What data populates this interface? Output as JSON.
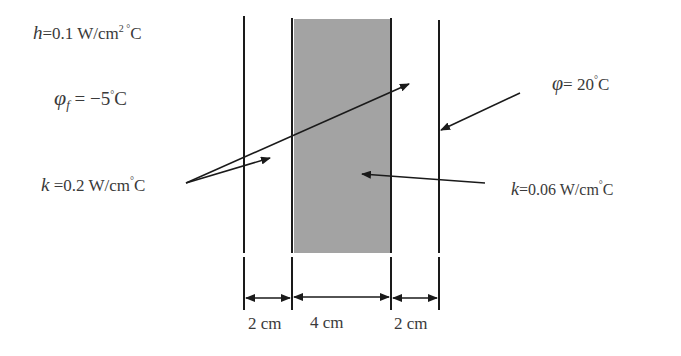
{
  "labels": {
    "h_symbol": "h",
    "h_value": "=0.1 W/cm",
    "h_sup": "2 °",
    "h_unit": "C",
    "phi_f_symbol": "φ",
    "phi_f_sub": "f",
    "phi_f_value": " = −5",
    "phi_f_sup": "°",
    "phi_f_unit": "C",
    "phi_symbol": "φ",
    "phi_value": "= 20",
    "phi_sup": "°",
    "phi_unit": "C",
    "k_outer_symbol": "k",
    "k_outer_value": " =0.2 W/cm",
    "k_outer_sup": "°",
    "k_outer_unit": "C",
    "k_inner_symbol": "k",
    "k_inner_value": "=0.06 W/cm",
    "k_inner_sup": "°",
    "k_inner_unit": "C"
  },
  "dimensions": [
    "2 cm",
    "4 cm",
    "2 cm"
  ],
  "colors": {
    "line": "#1a1a1a",
    "insulation_fill": "#a0a0a0",
    "text": "#3a3a3a"
  }
}
